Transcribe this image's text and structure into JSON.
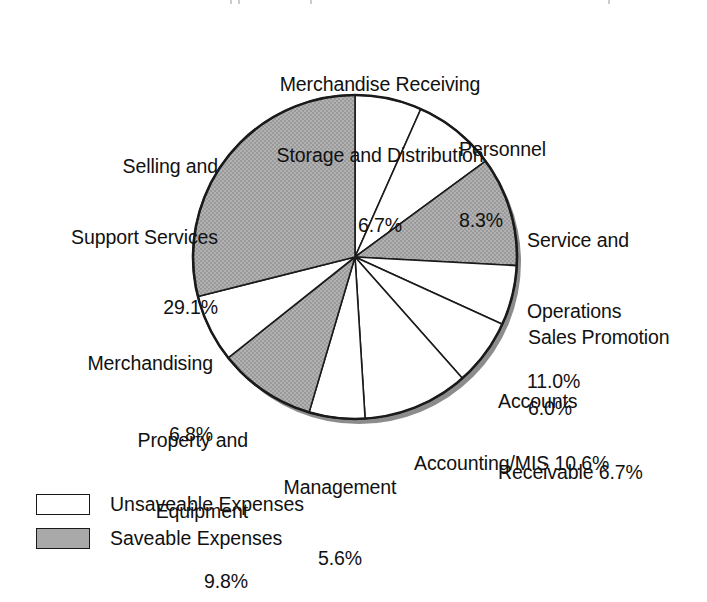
{
  "chart_data": {
    "type": "pie",
    "title": "",
    "subtitle": "",
    "xlabel": "",
    "ylabel": "",
    "units": "percent",
    "start_angle_deg": 0,
    "direction": "clockwise",
    "grid": false,
    "legend_position": "bottom-left",
    "categories": [
      "Merchandise Receiving Storage and Distribution",
      "Personnel",
      "Service and Operations",
      "Sales Promotion",
      "Accounts Receivable",
      "Accounting/MIS",
      "Management",
      "Property and Equipment",
      "Merchandising",
      "Selling and Support Services"
    ],
    "values": [
      6.7,
      8.3,
      11.0,
      6.0,
      6.7,
      10.6,
      5.6,
      9.8,
      6.8,
      29.1
    ],
    "value_labels": [
      "6.7%",
      "8.3%",
      "11.0%",
      "6.0%",
      "6.7%",
      "10.6%",
      "5.6%",
      "9.8%",
      "6.8%",
      "29.1%"
    ],
    "slice_groups": [
      "Unsaveable Expenses",
      "Unsaveable Expenses",
      "Saveable Expenses",
      "Unsaveable Expenses",
      "Unsaveable Expenses",
      "Unsaveable Expenses",
      "Unsaveable Expenses",
      "Saveable Expenses",
      "Unsaveable Expenses",
      "Saveable Expenses"
    ],
    "series": [
      {
        "name": "Expense share",
        "values": [
          6.7,
          8.3,
          11.0,
          6.0,
          6.7,
          10.6,
          5.6,
          9.8,
          6.8,
          29.1
        ]
      }
    ]
  },
  "colors": {
    "saveable_fill": "#a9a9a9",
    "unsaveable_fill": "#ffffff",
    "outline": "#1a1a1a",
    "shadow": "#8c8c8c",
    "text": "#111111",
    "background": "#ffffff"
  },
  "slice_labels": [
    {
      "key": "merchandise-receiving",
      "lines": [
        "Merchandise Receiving",
        "Storage and Distribution",
        "6.7%"
      ],
      "line1": "Merchandise Receiving",
      "line2": "Storage and Distribution",
      "line3": "6.7%"
    },
    {
      "key": "personnel",
      "lines": [
        "Personnel",
        "8.3%"
      ],
      "line1": "Personnel",
      "line2": "8.3%"
    },
    {
      "key": "service-and-operations",
      "lines": [
        "Service and",
        "Operations",
        "11.0%"
      ],
      "line1": "Service and",
      "line2": "Operations",
      "line3": "11.0%"
    },
    {
      "key": "sales-promotion",
      "lines": [
        "Sales Promotion",
        "6.0%"
      ],
      "line1": "Sales Promotion",
      "line2": "6.0%"
    },
    {
      "key": "accounts-receivable",
      "lines": [
        "Accounts",
        "Receivable 6.7%"
      ],
      "line1": "Accounts",
      "line2": "Receivable 6.7%"
    },
    {
      "key": "accounting-mis",
      "lines": [
        "Accounting/MIS 10.6%"
      ],
      "line1": "Accounting/MIS 10.6%"
    },
    {
      "key": "management",
      "lines": [
        "Management",
        "5.6%"
      ],
      "line1": "Management",
      "line2": "5.6%"
    },
    {
      "key": "property-and-equipment",
      "lines": [
        "Property and",
        "Equipment",
        "9.8%"
      ],
      "line1": "Property and",
      "line2": "Equipment",
      "line3": "9.8%"
    },
    {
      "key": "merchandising",
      "lines": [
        "Merchandising",
        "6.8%"
      ],
      "line1": "Merchandising",
      "line2": "6.8%"
    },
    {
      "key": "selling-and-support-services",
      "lines": [
        "Selling and",
        "Support Services",
        "29.1%"
      ],
      "line1": "Selling and",
      "line2": "Support Services",
      "line3": "29.1%"
    }
  ],
  "legend": {
    "items": [
      {
        "label": "Unsaveable Expenses",
        "swatch": "white"
      },
      {
        "label": "Saveable Expenses",
        "swatch": "gray"
      }
    ]
  }
}
